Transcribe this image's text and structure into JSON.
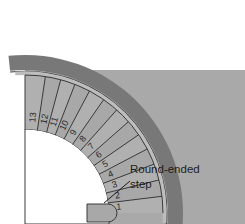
{
  "diagram": {
    "type": "architectural-plan",
    "colors": {
      "background": "#ffffff",
      "wall_dark": "#787878",
      "floor_gray": "#a9a9a9",
      "step_fill": "#a8a8a8",
      "step_fill_alt": "#b0b0b0",
      "line_dark": "#3a3a3a",
      "text": "#1d1d1d",
      "well_white": "#ffffff"
    },
    "geometry": {
      "center_x": 25,
      "center_y": 213,
      "inner_radius": 84,
      "outer_radius": 138,
      "wall_inner_radius": 143,
      "wall_outer_radius": 158,
      "start_angle_deg": 0,
      "end_angle_deg": 90,
      "step_count": 13
    },
    "steps": [
      {
        "number": "1",
        "angle_deg": 3.5
      },
      {
        "number": "2",
        "angle_deg": 10.4
      },
      {
        "number": "3",
        "angle_deg": 17.3
      },
      {
        "number": "4",
        "angle_deg": 24.2
      },
      {
        "number": "5",
        "angle_deg": 31.1
      },
      {
        "number": "6",
        "angle_deg": 38.0
      },
      {
        "number": "7",
        "angle_deg": 44.9
      },
      {
        "number": "8",
        "angle_deg": 51.8
      },
      {
        "number": "9",
        "angle_deg": 58.7
      },
      {
        "number": "10",
        "angle_deg": 65.6
      },
      {
        "number": "11",
        "angle_deg": 72.0
      },
      {
        "number": "12",
        "angle_deg": 78.0
      },
      {
        "number": "13",
        "angle_deg": 85.0
      }
    ],
    "callout": {
      "line1": "Round-ended",
      "line2": "step",
      "leader_from_x": 130,
      "leader_from_y": 181,
      "leader_to_x": 104,
      "leader_to_y": 203
    }
  }
}
